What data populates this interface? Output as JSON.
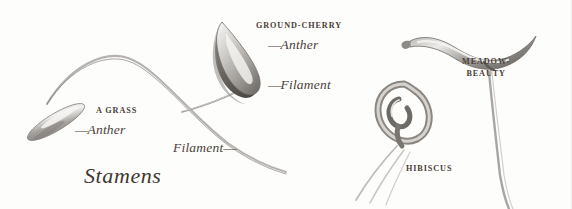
{
  "plate": {
    "title": "Stamens",
    "background_color": "#fdfdfc",
    "ink_color": "#4a4038"
  },
  "specimens": [
    {
      "id": "grass",
      "name": "A GRASS",
      "parts": [
        {
          "label": "Anther"
        },
        {
          "label": "Filament"
        }
      ]
    },
    {
      "id": "ground-cherry",
      "name": "GROUND-CHERRY",
      "parts": [
        {
          "label": "Anther"
        },
        {
          "label": "Filament"
        }
      ]
    },
    {
      "id": "hibiscus",
      "name": "HIBISCUS",
      "parts": []
    },
    {
      "id": "meadow-beauty",
      "name_line1": "MEADOW-",
      "name_line2": "BEAUTY",
      "parts": []
    }
  ],
  "labels": {
    "grass_species": "A GRASS",
    "grass_anther": "Anther",
    "grass_filament": "Filament",
    "groundcherry_species": "GROUND-CHERRY",
    "groundcherry_anther": "Anther",
    "groundcherry_filament": "Filament",
    "hibiscus_species": "HIBISCUS",
    "meadowbeauty_line1": "MEADOW-",
    "meadowbeauty_line2": "BEAUTY",
    "plate_title": "Stamens",
    "leader_dash": "—"
  }
}
